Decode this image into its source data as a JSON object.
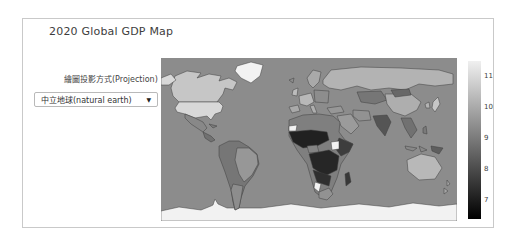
{
  "header": {
    "title": "2020 Global GDP Map"
  },
  "controls": {
    "projection_label": "繪圖投影方式(Projection)",
    "projection_select": {
      "value": "中立地球(natural earth)",
      "dropdown_icon": "▼"
    }
  },
  "panel": {
    "border_color": "#c9c9c9",
    "background": "#ffffff"
  },
  "chart_data": {
    "type": "heatmap",
    "subtype": "choropleth-world-map",
    "title": "2020 Global GDP Map",
    "projection": "natural earth",
    "legend_position": "right",
    "colorbar": {
      "orientation": "vertical",
      "low_color": "#000000",
      "high_color": "#f0f0f0",
      "min": 6.4,
      "max": 11.5,
      "ticks": [
        7,
        8,
        9,
        10,
        11
      ]
    },
    "ocean_color": "#8c8c8c",
    "border_color": "#3f3f3f",
    "no_data_color": "#f2f2f2",
    "values_note": "approximate values read from shading against the 7-11 colorbar; null = no data (white)",
    "regions": {
      "greenland": null,
      "antarctica": null,
      "canada": 10.6,
      "usa": 11.0,
      "mexico": 9.3,
      "central-america": 8.8,
      "cuba": 9.0,
      "iceland": 9.4,
      "south-america": 8.9,
      "brazil": 9.6,
      "argentina": 9.4,
      "scandinavia": 10.0,
      "uk": 10.4,
      "west-europe": 10.3,
      "iberia": 10.0,
      "italy": 10.1,
      "east-europe": 9.4,
      "russia": 10.2,
      "central-asia": 8.9,
      "turkey": 9.6,
      "middle-east": 9.7,
      "iran": 9.5,
      "north-africa": 9.1,
      "west-africa": 7.1,
      "nigeria": 9.2,
      "central-africa": 7.2,
      "east-africa": 7.7,
      "south-sudan": null,
      "western-sahara": null,
      "southern-africa": 7.4,
      "namibia": null,
      "south-africa": 9.5,
      "madagascar": 7.6,
      "india": 8.2,
      "china": 10.1,
      "mongolia": 8.6,
      "se-asia": 8.8,
      "indonesia": 9.3,
      "philippines": 9.0,
      "japan": 10.6,
      "korea": 10.2,
      "papua-new-guinea": 8.4,
      "australia": 10.3,
      "new-zealand": 9.9
    }
  }
}
